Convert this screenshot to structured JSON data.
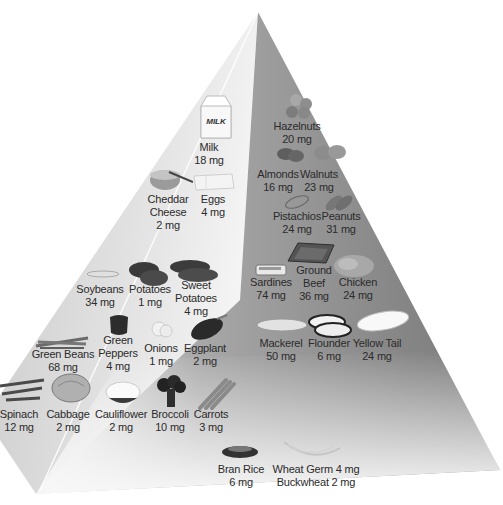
{
  "diagram": {
    "type": "food-pyramid",
    "background": "#ffffff",
    "colors": {
      "face_left": "#d6d6d6",
      "face_right": "#8a8a8a",
      "ridge": "#ffffff",
      "text": "#2b2b2b"
    },
    "items": [
      {
        "id": "milk",
        "lines": [
          "Milk",
          "18 mg"
        ],
        "icon": "milk-carton-icon"
      },
      {
        "id": "hazelnuts",
        "lines": [
          "Hazelnuts",
          "20 mg"
        ],
        "icon": "hazelnuts-icon"
      },
      {
        "id": "almonds",
        "lines": [
          "Almonds",
          "16 mg"
        ],
        "icon": "almonds-icon"
      },
      {
        "id": "walnuts",
        "lines": [
          "Walnuts",
          "23 mg"
        ],
        "icon": "walnuts-icon"
      },
      {
        "id": "cheddar",
        "lines": [
          "Cheddar",
          "Cheese",
          "2 mg"
        ],
        "icon": "cheese-icon"
      },
      {
        "id": "eggs",
        "lines": [
          "Eggs",
          "4 mg"
        ],
        "icon": "eggs-icon"
      },
      {
        "id": "pistachios",
        "lines": [
          "Pistachios",
          "24 mg"
        ],
        "icon": "pistachios-icon"
      },
      {
        "id": "peanuts",
        "lines": [
          "Peanuts",
          "31 mg"
        ],
        "icon": "peanuts-icon"
      },
      {
        "id": "sardines",
        "lines": [
          "Sardines",
          "74 mg"
        ],
        "icon": "sardine-can-icon"
      },
      {
        "id": "groundbeef",
        "lines": [
          "Ground",
          "Beef",
          "36 mg"
        ],
        "icon": "ground-beef-icon"
      },
      {
        "id": "chicken",
        "lines": [
          "Chicken",
          "24 mg"
        ],
        "icon": "chicken-icon"
      },
      {
        "id": "soybeans",
        "lines": [
          "Soybeans",
          "34 mg"
        ],
        "icon": "soybeans-icon"
      },
      {
        "id": "potatoes",
        "lines": [
          "Potatoes",
          "1 mg"
        ],
        "icon": "potatoes-icon"
      },
      {
        "id": "sweetpotatoes",
        "lines": [
          "Sweet",
          "Potatoes",
          "4 mg"
        ],
        "icon": "sweet-potatoes-icon"
      },
      {
        "id": "mackerel",
        "lines": [
          "Mackerel",
          "50 mg"
        ],
        "icon": "mackerel-icon"
      },
      {
        "id": "flounder",
        "lines": [
          "Flounder",
          "6 mg"
        ],
        "icon": "flounder-icon"
      },
      {
        "id": "yellowtail",
        "lines": [
          "Yellow Tail",
          "24 mg"
        ],
        "icon": "yellowtail-icon"
      },
      {
        "id": "greenbeans",
        "lines": [
          "Green Beans",
          "68 mg"
        ],
        "icon": "green-beans-icon"
      },
      {
        "id": "greenpeppers",
        "lines": [
          "Green",
          "Peppers",
          "4 mg"
        ],
        "icon": "green-pepper-icon"
      },
      {
        "id": "onions",
        "lines": [
          "Onions",
          "1 mg"
        ],
        "icon": "onions-icon"
      },
      {
        "id": "eggplant",
        "lines": [
          "Eggplant",
          "2 mg"
        ],
        "icon": "eggplant-icon"
      },
      {
        "id": "spinach",
        "lines": [
          "Spinach",
          "12 mg"
        ],
        "icon": "spinach-icon"
      },
      {
        "id": "cabbage",
        "lines": [
          "Cabbage",
          "2 mg"
        ],
        "icon": "cabbage-icon"
      },
      {
        "id": "cauliflower",
        "lines": [
          "Cauliflower",
          "2 mg"
        ],
        "icon": "cauliflower-icon"
      },
      {
        "id": "broccoli",
        "lines": [
          "Broccoli",
          "10 mg"
        ],
        "icon": "broccoli-icon"
      },
      {
        "id": "carrots",
        "lines": [
          "Carrots",
          "3 mg"
        ],
        "icon": "carrots-icon"
      },
      {
        "id": "branrice",
        "lines": [
          "Bran Rice",
          "6 mg"
        ],
        "icon": "rice-bowl-icon"
      },
      {
        "id": "wheat",
        "lines": [
          "Wheat Germ 4 mg",
          "Buckwheat 2 mg"
        ],
        "icon": "wheat-icon"
      }
    ]
  }
}
